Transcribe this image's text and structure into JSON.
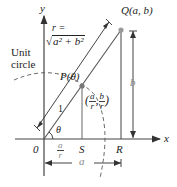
{
  "diagram": {
    "axes": {
      "x_label": "x",
      "y_label": "y",
      "origin_label": "0"
    },
    "circle_label_line1": "Unit",
    "circle_label_line2": "circle",
    "r_label": "r =",
    "r_formula": "a² + b²",
    "q_label": "Q(a, b)",
    "p_label": "P(θ)",
    "point_coords": {
      "open": "(",
      "a_num": "a",
      "a_den": "r",
      "sep": ",",
      "b_num": "b",
      "b_den": "r",
      "close": ")"
    },
    "unit_length_label": "1",
    "angle_label": "θ",
    "s_label": "S",
    "r_point_label": "R",
    "os_num": "a",
    "os_den": "r",
    "a_dim_label": "a",
    "b_dim_label": "b",
    "colors": {
      "stroke": "#333333",
      "point": "#888888",
      "dim": "#999999"
    }
  }
}
